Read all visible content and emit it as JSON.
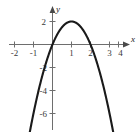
{
  "chart_data": {
    "type": "line",
    "title": "",
    "subtitle": "",
    "xlabel": "x",
    "ylabel": "y",
    "xlim": [
      -2.45,
      4.45
    ],
    "ylim": [
      -7.4,
      2.85
    ],
    "xticks": [
      -2,
      -1,
      1,
      2,
      3,
      4
    ],
    "yticks": [
      2,
      -2,
      -4,
      -6
    ],
    "xtick_labels": [
      "-2",
      "-1",
      "1",
      "2",
      "3",
      "4"
    ],
    "ytick_labels": [
      "2",
      "-2",
      "-4",
      "-6"
    ],
    "grid": false,
    "legend": null,
    "axis_arrows": [
      "x-positive",
      "y-positive"
    ],
    "series": [
      {
        "name": "parabola",
        "color": "#1a1a1a",
        "equation": "y = -2(x - 1)^2 + 2",
        "vertex": [
          1,
          2
        ],
        "x_intercepts": [
          0,
          2
        ],
        "y_intercept": 0,
        "opens": "down",
        "x": [
          -1.75,
          -1.5,
          -1.25,
          -1.0,
          -0.75,
          -0.5,
          -0.25,
          0,
          0.25,
          0.5,
          0.75,
          1.0,
          1.25,
          1.5,
          1.75,
          2.0,
          2.25,
          2.5,
          2.75,
          3.0,
          3.25,
          3.5,
          3.75
        ],
        "y": [
          -13.1,
          -10.5,
          -8.1,
          -6.0,
          -4.1,
          -2.5,
          -1.1,
          0,
          0.9,
          1.5,
          1.9,
          2.0,
          1.9,
          1.5,
          0.9,
          0,
          -1.1,
          -2.5,
          -4.1,
          -6.0,
          -8.1,
          -10.5,
          -13.1
        ]
      }
    ]
  },
  "axis_labels": {
    "x": "x",
    "y": "y"
  },
  "ticks": {
    "x": [
      {
        "label": "-2",
        "value": -2
      },
      {
        "label": "-1",
        "value": -1
      },
      {
        "label": "1",
        "value": 1
      },
      {
        "label": "2",
        "value": 2
      },
      {
        "label": "3",
        "value": 3
      },
      {
        "label": "4",
        "value": 4
      }
    ],
    "y": [
      {
        "label": "2",
        "value": 2
      },
      {
        "label": "-2",
        "value": -2
      },
      {
        "label": "-4",
        "value": -4
      },
      {
        "label": "-6",
        "value": -6
      }
    ]
  },
  "colors": {
    "curve": "#1a1a1a",
    "axis": "#6e6e6e",
    "text": "#3a3a3a",
    "background": "#ffffff"
  }
}
